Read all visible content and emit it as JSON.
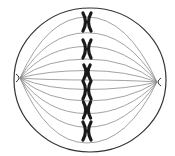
{
  "diagram": {
    "colors": {
      "background": "#ffffff",
      "membrane": "#333333",
      "spindle": "#8a8a8a",
      "chromosome": "#1a1a1a"
    },
    "cell": {
      "cx": 90,
      "cy": 80,
      "rx": 76,
      "ry": 72
    },
    "poles": [
      {
        "name": "left",
        "x": 17,
        "y": 78
      },
      {
        "name": "right",
        "x": 160,
        "y": 82
      }
    ],
    "metaphase_plate_x": 87,
    "chromosomes": [
      {
        "y": 22,
        "size": 9
      },
      {
        "y": 49,
        "size": 9
      },
      {
        "y": 72,
        "size": 7
      },
      {
        "y": 90,
        "size": 9
      },
      {
        "y": 110,
        "size": 8
      },
      {
        "y": 131,
        "size": 9
      }
    ],
    "spindle_bows": [
      -60,
      -45,
      -32,
      -20,
      -9,
      0,
      9,
      20,
      32,
      45,
      60
    ]
  }
}
